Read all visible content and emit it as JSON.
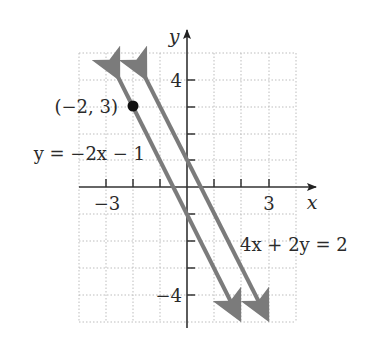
{
  "figure": {
    "title": "",
    "axes": {
      "x_label": "x",
      "y_label": "y",
      "x_range": [
        -4,
        4
      ],
      "y_range": [
        -5,
        5
      ],
      "x_tick_labels": [
        {
          "value": -3,
          "label": "−3"
        },
        {
          "value": 3,
          "label": "3"
        }
      ],
      "y_tick_labels": [
        {
          "value": 4,
          "label": "4"
        },
        {
          "value": -4,
          "label": "−4"
        }
      ],
      "grid": "dotted"
    },
    "lines": [
      {
        "id": "line1",
        "equation_label": "y = −2x − 1",
        "slope": -2,
        "intercept": -1,
        "from": [
          -3,
          5
        ],
        "to": [
          2,
          -5
        ]
      },
      {
        "id": "line2",
        "equation_label": "4x + 2y = 2",
        "slope": -2,
        "intercept": 1,
        "from": [
          -2,
          5
        ],
        "to": [
          3,
          -5
        ]
      }
    ],
    "points": [
      {
        "label": "(−2, 3)",
        "x": -2,
        "y": 3
      }
    ],
    "colors": {
      "line": "#7b7b7b",
      "axis": "#333333",
      "grid": "#bdbdbd",
      "point": "#111111"
    }
  }
}
